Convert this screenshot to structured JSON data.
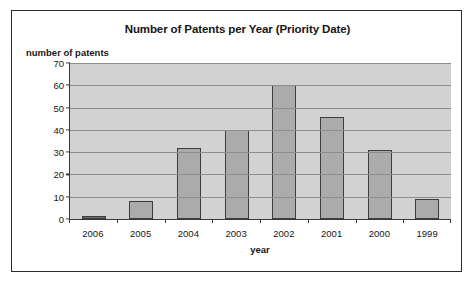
{
  "chart_data": {
    "type": "bar",
    "title": "Number of Patents per Year (Priority Date)",
    "xlabel": "year",
    "ylabel": "number of patents",
    "categories": [
      "2006",
      "2005",
      "2004",
      "2003",
      "2002",
      "2001",
      "2000",
      "1999"
    ],
    "values": [
      1,
      8,
      32,
      40,
      60,
      46,
      31,
      9
    ],
    "ylim": [
      0,
      70
    ],
    "ytick_labels": [
      "70",
      "60",
      "50",
      "40",
      "30",
      "20",
      "10",
      "0"
    ],
    "yticks": [
      70,
      60,
      50,
      40,
      30,
      20,
      10,
      0
    ],
    "grid": true,
    "legend": false,
    "colors": {
      "bar_fill": "#ababab",
      "bar_border": "#3c3c3c",
      "plot_background": "#d2d2d2",
      "gridline": "#8d8d8d",
      "axis": "#3a3a3a",
      "text": "#161616",
      "frame": "#2b2b2b"
    }
  }
}
